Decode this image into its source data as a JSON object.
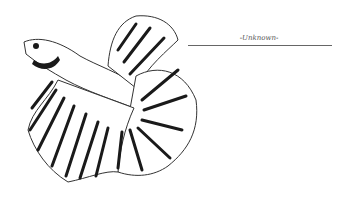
{
  "illustration": {
    "subject": "betta fish line art",
    "colors": {
      "ink": "#1a1a1a",
      "background": "#ffffff"
    }
  },
  "caption": {
    "text": "-Unknown-"
  }
}
